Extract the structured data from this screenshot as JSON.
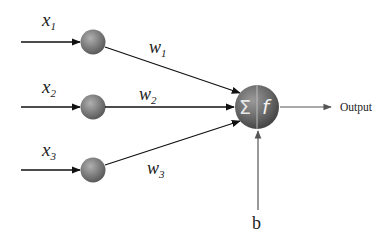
{
  "diagram": {
    "type": "perceptron",
    "inputs": [
      {
        "label": "x",
        "sub": "1",
        "weight_label": "w",
        "weight_sub": "1"
      },
      {
        "label": "x",
        "sub": "2",
        "weight_label": "w",
        "weight_sub": "2"
      },
      {
        "label": "x",
        "sub": "3",
        "weight_label": "w",
        "weight_sub": "3"
      }
    ],
    "neuron": {
      "sum_symbol": "Σ",
      "activation_symbol": "f"
    },
    "bias_label": "b",
    "output_label": "Output",
    "colors": {
      "line": "#111111",
      "node": "#7a7a7a",
      "neuron": "#6a6a6a",
      "text": "#222222"
    }
  }
}
